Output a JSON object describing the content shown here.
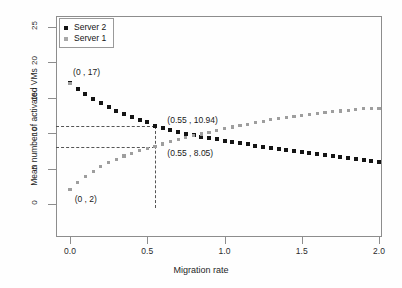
{
  "chart_data": {
    "type": "scatter",
    "title": "",
    "xlabel": "Migration rate",
    "ylabel": "Mean number of activated VMs",
    "xlim": [
      -0.05,
      2.05
    ],
    "ylim": [
      -0.6,
      26.5
    ],
    "xticks": [
      "0.0",
      "0.5",
      "1.0",
      "1.5",
      "2.0"
    ],
    "xtick_values": [
      0.0,
      0.5,
      1.0,
      1.5,
      2.0
    ],
    "yticks": [
      "0",
      "5",
      "10",
      "15",
      "20",
      "25"
    ],
    "ytick_values": [
      0,
      5,
      10,
      15,
      20,
      25
    ],
    "grid": false,
    "legend_position": "top-left",
    "legend": [
      "Server 2",
      "Server 1"
    ],
    "series": [
      {
        "name": "Server 2",
        "color": "#141414",
        "marker": "square",
        "x": [
          0.0,
          0.05,
          0.1,
          0.15,
          0.2,
          0.25,
          0.3,
          0.35,
          0.4,
          0.45,
          0.5,
          0.55,
          0.6,
          0.65,
          0.7,
          0.75,
          0.8,
          0.85,
          0.9,
          0.95,
          1.0,
          1.05,
          1.1,
          1.15,
          1.2,
          1.25,
          1.3,
          1.35,
          1.4,
          1.45,
          1.5,
          1.55,
          1.6,
          1.65,
          1.7,
          1.75,
          1.8,
          1.85,
          1.9,
          1.95,
          2.0
        ],
        "values": [
          17.0,
          16.2,
          15.45,
          14.8,
          14.2,
          13.65,
          13.15,
          12.7,
          12.3,
          11.9,
          11.5,
          10.94,
          10.65,
          10.4,
          10.15,
          9.9,
          9.7,
          9.5,
          9.3,
          9.1,
          8.9,
          8.72,
          8.55,
          8.4,
          8.2,
          8.05,
          7.9,
          7.75,
          7.6,
          7.45,
          7.3,
          7.15,
          7.0,
          6.85,
          6.72,
          6.6,
          6.45,
          6.3,
          6.15,
          6.0,
          5.85
        ]
      },
      {
        "name": "Server 1",
        "color": "#9e9e9e",
        "marker": "square",
        "x": [
          0.0,
          0.05,
          0.1,
          0.15,
          0.2,
          0.25,
          0.3,
          0.35,
          0.4,
          0.45,
          0.5,
          0.55,
          0.6,
          0.65,
          0.7,
          0.75,
          0.8,
          0.85,
          0.9,
          0.95,
          1.0,
          1.05,
          1.1,
          1.15,
          1.2,
          1.25,
          1.3,
          1.35,
          1.4,
          1.45,
          1.5,
          1.55,
          1.6,
          1.65,
          1.7,
          1.75,
          1.8,
          1.85,
          1.9,
          1.95,
          2.0
        ],
        "values": [
          2.0,
          3.0,
          3.85,
          4.6,
          5.25,
          5.8,
          6.3,
          6.75,
          7.15,
          7.5,
          7.8,
          8.05,
          8.45,
          8.75,
          9.05,
          9.35,
          9.6,
          9.85,
          10.1,
          10.35,
          10.6,
          10.85,
          11.05,
          11.25,
          11.45,
          11.65,
          11.85,
          12.0,
          12.2,
          12.35,
          12.5,
          12.62,
          12.75,
          12.9,
          13.0,
          13.1,
          13.2,
          13.3,
          13.4,
          13.45,
          13.5
        ]
      }
    ],
    "annotations": [
      {
        "text": "(0 , 17)",
        "x": 0.0,
        "y": 17.0,
        "label_x": 0.02,
        "label_y": 18.4
      },
      {
        "text": "(0 , 2)",
        "x": 0.0,
        "y": 2.0,
        "label_x": 0.03,
        "label_y": 0.55
      },
      {
        "text": "(0.55 , 10.94)",
        "x": 0.55,
        "y": 10.94,
        "label_x": 0.63,
        "label_y": 11.75
      },
      {
        "text": "(0.55 , 8.05)",
        "x": 0.55,
        "y": 8.05,
        "label_x": 0.63,
        "label_y": 7.0
      }
    ],
    "guides": {
      "horizontal": [
        10.94,
        8.05
      ],
      "vertical": [
        0.55
      ],
      "style": "dashed",
      "color": "#555555"
    }
  }
}
